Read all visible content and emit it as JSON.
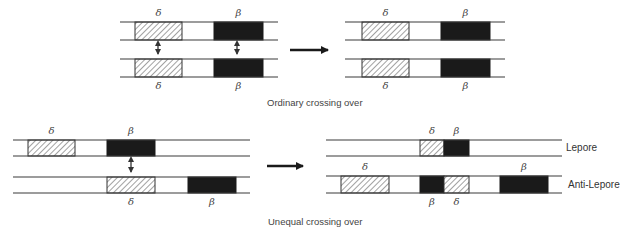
{
  "colors": {
    "line": "#3a3a3a",
    "filled": "#1a1a1a",
    "hatch": "#555555",
    "background": "#ffffff"
  },
  "captions": {
    "ordinary": "Ordinary crossing over",
    "unequal": "Unequal crossing over"
  },
  "labels": {
    "lepore": "Lepore",
    "anti_lepore": "Anti-Lepore"
  },
  "gene_symbols": {
    "delta": "δ",
    "beta": "β"
  },
  "legend": {
    "hatched_box": "δ-globin gene",
    "solid_box": "β-globin gene"
  },
  "panels": [
    {
      "id": "ordinary-before",
      "chromosomes": [
        {
          "x1": 120,
          "x2": 278,
          "y_top": 22,
          "y_bot": 40,
          "genes": [
            {
              "type": "delta",
              "x1": 135,
              "x2": 182,
              "label_pos": "above"
            },
            {
              "type": "beta",
              "x1": 214,
              "x2": 263,
              "label_pos": "above"
            }
          ]
        },
        {
          "x1": 120,
          "x2": 278,
          "y_top": 59,
          "y_bot": 77,
          "genes": [
            {
              "type": "delta",
              "x1": 135,
              "x2": 182,
              "label_pos": "below"
            },
            {
              "type": "beta",
              "x1": 214,
              "x2": 263,
              "label_pos": "below"
            }
          ]
        }
      ],
      "pairing_arrows": [
        {
          "x": 158,
          "y1": 42,
          "y2": 57
        },
        {
          "x": 237,
          "y1": 42,
          "y2": 57
        }
      ]
    },
    {
      "id": "ordinary-after",
      "chromosomes": [
        {
          "x1": 345,
          "x2": 505,
          "y_top": 22,
          "y_bot": 40,
          "genes": [
            {
              "type": "delta",
              "x1": 362,
              "x2": 409,
              "label_pos": "above"
            },
            {
              "type": "beta",
              "x1": 441,
              "x2": 490,
              "label_pos": "above"
            }
          ]
        },
        {
          "x1": 345,
          "x2": 505,
          "y_top": 59,
          "y_bot": 77,
          "genes": [
            {
              "type": "delta",
              "x1": 362,
              "x2": 409,
              "label_pos": "below"
            },
            {
              "type": "beta",
              "x1": 441,
              "x2": 490,
              "label_pos": "below"
            }
          ]
        }
      ],
      "pairing_arrows": []
    },
    {
      "id": "unequal-before",
      "chromosomes": [
        {
          "x1": 13,
          "x2": 250,
          "y_top": 140,
          "y_bot": 156,
          "genes": [
            {
              "type": "delta",
              "x1": 28,
              "x2": 75,
              "label_pos": "above"
            },
            {
              "type": "beta",
              "x1": 107,
              "x2": 155,
              "label_pos": "above"
            }
          ]
        },
        {
          "x1": 13,
          "x2": 250,
          "y_top": 177,
          "y_bot": 193,
          "genes": [
            {
              "type": "delta",
              "x1": 107,
              "x2": 155,
              "label_pos": "below"
            },
            {
              "type": "beta",
              "x1": 188,
              "x2": 236,
              "label_pos": "below"
            }
          ]
        }
      ],
      "pairing_arrows": [
        {
          "x": 131,
          "y1": 158,
          "y2": 175
        }
      ]
    },
    {
      "id": "unequal-after",
      "chromosomes": [
        {
          "x1": 326,
          "x2": 562,
          "y_top": 140,
          "y_bot": 156,
          "name": "lepore",
          "genes": [
            {
              "type": "delta",
              "x1": 420,
              "x2": 444,
              "label_pos": "above"
            },
            {
              "type": "beta",
              "x1": 444,
              "x2": 469,
              "label_pos": "above"
            }
          ]
        },
        {
          "x1": 326,
          "x2": 562,
          "y_top": 176,
          "y_bot": 193,
          "name": "anti_lepore",
          "genes": [
            {
              "type": "delta",
              "x1": 341,
              "x2": 389,
              "label_pos": "above"
            },
            {
              "type": "beta",
              "x1": 420,
              "x2": 444,
              "label_pos": "below"
            },
            {
              "type": "delta",
              "x1": 444,
              "x2": 469,
              "label_pos": "below"
            },
            {
              "type": "beta",
              "x1": 500,
              "x2": 548,
              "label_pos": "above"
            }
          ]
        }
      ],
      "pairing_arrows": []
    }
  ],
  "transition_arrows": [
    {
      "id": "ordinary-arrow",
      "x1": 290,
      "x2": 334,
      "y": 50
    },
    {
      "id": "unequal-arrow",
      "x1": 267,
      "x2": 309,
      "y": 166
    }
  ]
}
